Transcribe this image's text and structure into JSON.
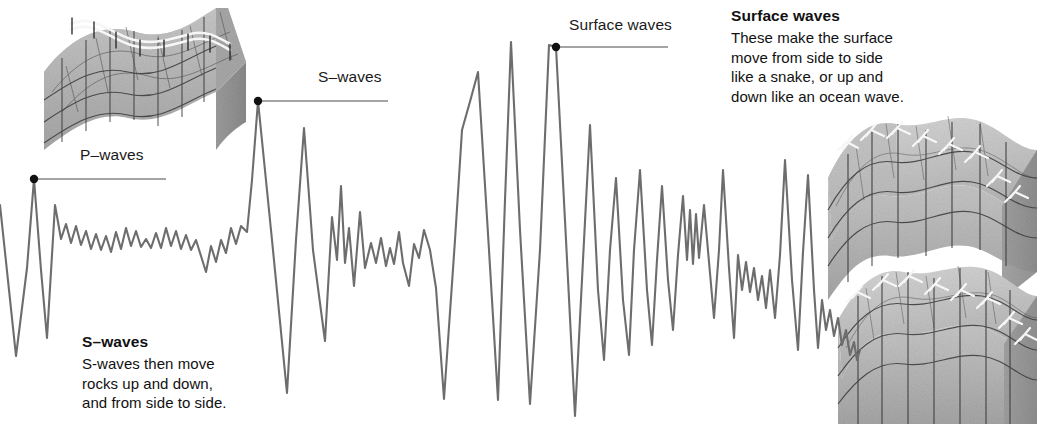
{
  "figure": {
    "type": "seismogram-diagram",
    "background_color": "#ffffff",
    "trace_color": "#6d6d6d",
    "leader_color": "#4a4a4a",
    "text_color": "#111111"
  },
  "labels": {
    "p_waves": "P–waves",
    "s_waves_inline": "S–waves",
    "surface_waves_inline": "Surface waves"
  },
  "notes": {
    "s_waves": {
      "title": "S–waves",
      "lines": [
        "S-waves then move",
        "rocks up and down,",
        "and from side to side."
      ]
    },
    "surface_waves": {
      "title": "Surface waves",
      "lines": [
        "These make the surface",
        "move from side to side",
        "like a snake, or up and",
        "down like an ocean wave."
      ]
    }
  },
  "callouts": [
    {
      "name": "p-waves",
      "dot_x": 34,
      "dot_y": 179,
      "line_to_x": 166,
      "label_x": 80,
      "label_y": 157
    },
    {
      "name": "s-waves",
      "dot_x": 258,
      "dot_y": 101,
      "line_to_x": 388,
      "label_x": 318,
      "label_y": 79
    },
    {
      "name": "surface-waves",
      "dot_x": 556,
      "dot_y": 47,
      "line_to_x": 668,
      "label_x": 569,
      "label_y": 26
    }
  ],
  "chart_data": {
    "type": "line",
    "xlabel": "",
    "ylabel": "",
    "grid": false,
    "legend": "none",
    "xlim": [
      0,
      1037
    ],
    "ylim": [
      424,
      0
    ],
    "note": "y values are screen pixels; smaller y = larger upward ground motion",
    "series": [
      {
        "name": "ground-motion-trace",
        "color": "#6d6d6d",
        "points": [
          [
            0,
            205
          ],
          [
            16,
            356
          ],
          [
            27,
            268
          ],
          [
            34,
            179
          ],
          [
            41,
            270
          ],
          [
            47,
            338
          ],
          [
            55,
            205
          ],
          [
            61,
            239
          ],
          [
            66,
            224
          ],
          [
            71,
            243
          ],
          [
            76,
            226
          ],
          [
            81,
            245
          ],
          [
            86,
            231
          ],
          [
            91,
            249
          ],
          [
            96,
            234
          ],
          [
            101,
            250
          ],
          [
            106,
            236
          ],
          [
            111,
            252
          ],
          [
            116,
            232
          ],
          [
            121,
            249
          ],
          [
            126,
            228
          ],
          [
            131,
            246
          ],
          [
            136,
            231
          ],
          [
            141,
            247
          ],
          [
            146,
            239
          ],
          [
            151,
            248
          ],
          [
            156,
            233
          ],
          [
            161,
            248
          ],
          [
            166,
            228
          ],
          [
            171,
            246
          ],
          [
            176,
            231
          ],
          [
            181,
            249
          ],
          [
            186,
            235
          ],
          [
            191,
            250
          ],
          [
            196,
            240
          ],
          [
            201,
            256
          ],
          [
            206,
            272
          ],
          [
            211,
            246
          ],
          [
            216,
            262
          ],
          [
            221,
            240
          ],
          [
            226,
            253
          ],
          [
            231,
            228
          ],
          [
            236,
            244
          ],
          [
            241,
            226
          ],
          [
            247,
            232
          ],
          [
            252,
            180
          ],
          [
            258,
            101
          ],
          [
            272,
            240
          ],
          [
            287,
            393
          ],
          [
            296,
            240
          ],
          [
            304,
            128
          ],
          [
            313,
            250
          ],
          [
            325,
            341
          ],
          [
            332,
            217
          ],
          [
            337,
            260
          ],
          [
            341,
            186
          ],
          [
            345,
            263
          ],
          [
            349,
            228
          ],
          [
            354,
            286
          ],
          [
            360,
            212
          ],
          [
            365,
            268
          ],
          [
            371,
            243
          ],
          [
            376,
            263
          ],
          [
            381,
            238
          ],
          [
            386,
            266
          ],
          [
            390,
            248
          ],
          [
            394,
            264
          ],
          [
            399,
            232
          ],
          [
            403,
            263
          ],
          [
            409,
            286
          ],
          [
            414,
            244
          ],
          [
            419,
            258
          ],
          [
            424,
            230
          ],
          [
            430,
            250
          ],
          [
            436,
            288
          ],
          [
            444,
            399
          ],
          [
            455,
            240
          ],
          [
            462,
            130
          ],
          [
            471,
            98
          ],
          [
            478,
            72
          ],
          [
            489,
            250
          ],
          [
            498,
            400
          ],
          [
            505,
            200
          ],
          [
            511,
            42
          ],
          [
            520,
            230
          ],
          [
            530,
            404
          ],
          [
            540,
            250
          ],
          [
            549,
            45
          ],
          [
            556,
            47
          ],
          [
            566,
            240
          ],
          [
            575,
            416
          ],
          [
            583,
            260
          ],
          [
            590,
            125
          ],
          [
            598,
            290
          ],
          [
            604,
            360
          ],
          [
            610,
            250
          ],
          [
            616,
            178
          ],
          [
            623,
            300
          ],
          [
            629,
            355
          ],
          [
            634,
            250
          ],
          [
            640,
            170
          ],
          [
            647,
            290
          ],
          [
            652,
            345
          ],
          [
            657,
            260
          ],
          [
            662,
            186
          ],
          [
            668,
            280
          ],
          [
            673,
            330
          ],
          [
            678,
            255
          ],
          [
            683,
            196
          ],
          [
            687,
            260
          ],
          [
            690,
            210
          ],
          [
            693,
            264
          ],
          [
            696,
            214
          ],
          [
            699,
            258
          ],
          [
            704,
            205
          ],
          [
            709,
            262
          ],
          [
            714,
            318
          ],
          [
            719,
            250
          ],
          [
            723,
            170
          ],
          [
            729,
            268
          ],
          [
            734,
            338
          ],
          [
            738,
            255
          ],
          [
            742,
            290
          ],
          [
            746,
            262
          ],
          [
            750,
            292
          ],
          [
            754,
            268
          ],
          [
            758,
            300
          ],
          [
            762,
            276
          ],
          [
            766,
            308
          ],
          [
            770,
            270
          ],
          [
            775,
            318
          ],
          [
            780,
            255
          ],
          [
            785,
            160
          ],
          [
            792,
            280
          ],
          [
            798,
            350
          ],
          [
            803,
            252
          ],
          [
            808,
            175
          ],
          [
            814,
            290
          ],
          [
            818,
            348
          ],
          [
            822,
            300
          ],
          [
            826,
            330
          ],
          [
            830,
            310
          ],
          [
            834,
            336
          ],
          [
            838,
            318
          ],
          [
            842,
            345
          ],
          [
            846,
            330
          ],
          [
            850,
            355
          ],
          [
            854,
            342
          ],
          [
            857,
            360
          ],
          [
            860,
            350
          ]
        ]
      }
    ]
  },
  "illustrations": [
    {
      "name": "p-wave-rock-block",
      "description": "3D block of rock with wavy compressed surface, grid lines and white fence along the top ridge",
      "x": 38,
      "y": 4,
      "width": 200,
      "height": 160,
      "rock_light": "#cfcfcf",
      "rock_mid": "#b4b4b4",
      "rock_dark": "#9a9a9a",
      "grid": "#3c3c3c",
      "fence": "#ffffff"
    },
    {
      "name": "surface-wave-rock-block-upper",
      "description": "3D block of rock with undulating surface, grid lines and white fence posts along the top ridge",
      "x": 822,
      "y": 120,
      "width": 215,
      "height": 165,
      "rock_light": "#cfcfcf",
      "rock_mid": "#b4b4b4",
      "rock_dark": "#9a9a9a",
      "grid": "#3c3c3c",
      "fence": "#ffffff"
    },
    {
      "name": "surface-wave-rock-block-lower",
      "description": "3D block of rock with undulating surface, grid lines and white fence posts along the top ridge",
      "x": 832,
      "y": 262,
      "width": 205,
      "height": 160,
      "rock_light": "#cfcfcf",
      "rock_mid": "#b4b4b4",
      "rock_dark": "#9a9a9a",
      "grid": "#3c3c3c",
      "fence": "#ffffff"
    }
  ]
}
